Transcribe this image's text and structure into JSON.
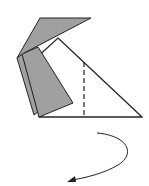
{
  "diagram": {
    "type": "origami-folding-step",
    "colors": {
      "paper_front": "#ffffff",
      "paper_back": "#a0a0a0",
      "stroke": "#222222",
      "background": "#ffffff"
    },
    "elements": [
      {
        "name": "top-gray-flap",
        "kind": "folded-flap",
        "color": "#a0a0a0"
      },
      {
        "name": "left-gray-layers",
        "kind": "folded-layers",
        "color": "#a0a0a0"
      },
      {
        "name": "white-triangle",
        "kind": "paper-face",
        "color": "#ffffff"
      },
      {
        "name": "valley-fold-line",
        "kind": "dashed-fold-line"
      },
      {
        "name": "turn-over-arrow",
        "kind": "curved-arrow"
      }
    ]
  }
}
